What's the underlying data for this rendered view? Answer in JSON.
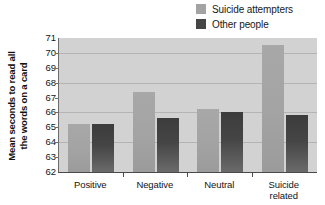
{
  "chart_data": {
    "type": "bar",
    "title": "",
    "subtitle": "",
    "xlabel": "",
    "ylabel": "Mean seconds to read all the words on a card",
    "ylabel_lines": [
      "Mean seconds to read all",
      "the words on a card"
    ],
    "categories": [
      "Positive",
      "Negative",
      "Neutral",
      "Suicide related"
    ],
    "category_lines": [
      [
        "Positive"
      ],
      [
        "Negative"
      ],
      [
        "Neutral"
      ],
      [
        "Suicide",
        "related"
      ]
    ],
    "series": [
      {
        "name": "Suicide attempters",
        "color": "#a3a3a3",
        "values": [
          65.2,
          67.4,
          66.2,
          70.5
        ]
      },
      {
        "name": "Other people",
        "color": "#454545",
        "values": [
          65.2,
          65.6,
          66.0,
          65.8
        ]
      }
    ],
    "ylim": [
      62,
      71
    ],
    "yticks": [
      62,
      63,
      64,
      65,
      66,
      67,
      68,
      69,
      70,
      71
    ],
    "ytick_labels": [
      "62",
      "63",
      "64",
      "65",
      "66",
      "67",
      "68",
      "69",
      "70",
      "71"
    ],
    "gridlines": [
      64,
      66,
      68,
      70
    ],
    "grid": true,
    "legend_position": "top-right",
    "plot_background": "#d2d2d2"
  },
  "legend": {
    "items": [
      {
        "label": "Suicide attempters",
        "color": "#a3a3a3"
      },
      {
        "label": "Other people",
        "color": "#454545"
      }
    ]
  }
}
